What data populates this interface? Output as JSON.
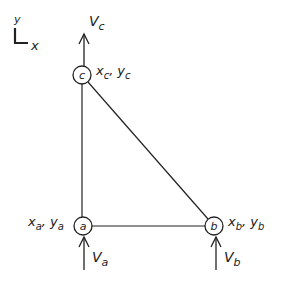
{
  "diagram": {
    "type": "triangular element",
    "axes": {
      "x_label": "x",
      "y_label": "y"
    },
    "nodes": [
      {
        "id": "a",
        "label": "a",
        "coord_label": "x",
        "coord_sub": "a",
        "coord_label2": "y",
        "coord_sub2": "a",
        "force_label": "V",
        "force_sub": "a"
      },
      {
        "id": "b",
        "label": "b",
        "coord_label": "x",
        "coord_sub": "b",
        "coord_label2": "y",
        "coord_sub2": "b",
        "force_label": "V",
        "force_sub": "b"
      },
      {
        "id": "c",
        "label": "c",
        "coord_label": "x",
        "coord_sub": "c",
        "coord_label2": "y",
        "coord_sub2": "c",
        "force_label": "V",
        "force_sub": "c"
      }
    ],
    "edges": [
      {
        "from": "a",
        "to": "b"
      },
      {
        "from": "b",
        "to": "c"
      },
      {
        "from": "c",
        "to": "a"
      }
    ],
    "separator": ",",
    "colors": {
      "stroke": "#222222",
      "background": "#ffffff"
    }
  }
}
